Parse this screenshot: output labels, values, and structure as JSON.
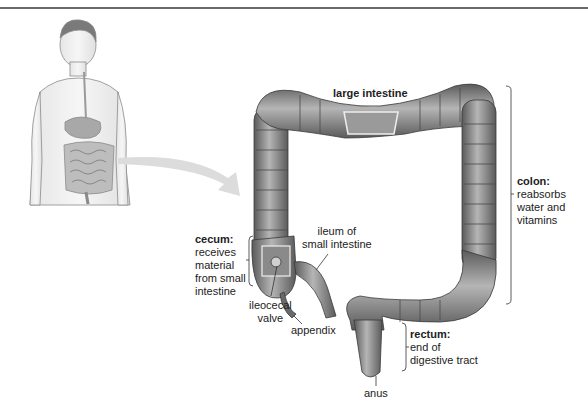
{
  "diagram": {
    "title": "large intestine",
    "labels": {
      "colon": {
        "term": "colon:",
        "lines": [
          "reabsorbs",
          "water and",
          "vitamins"
        ]
      },
      "cecum": {
        "term": "cecum:",
        "lines": [
          "receives",
          "material",
          "from small",
          "intestine"
        ]
      },
      "ileum": {
        "lines": [
          "ileum of",
          "small intestine"
        ]
      },
      "ileocecal_valve": {
        "lines": [
          "ileocecal",
          "valve"
        ]
      },
      "appendix": {
        "text": "appendix"
      },
      "rectum": {
        "term": "rectum:",
        "lines": [
          "end of",
          "digestive tract"
        ]
      },
      "anus": {
        "text": "anus"
      }
    },
    "figure": {
      "description": "human torso showing digestive system",
      "arrow": "points to enlarged large intestine"
    },
    "colors": {
      "tissue": "#8a8a8a",
      "tissue_dark": "#4a4a4a",
      "tissue_light": "#c8c8c8",
      "arrow": "#d8d8d8",
      "rule": "#6a6a6a"
    }
  }
}
